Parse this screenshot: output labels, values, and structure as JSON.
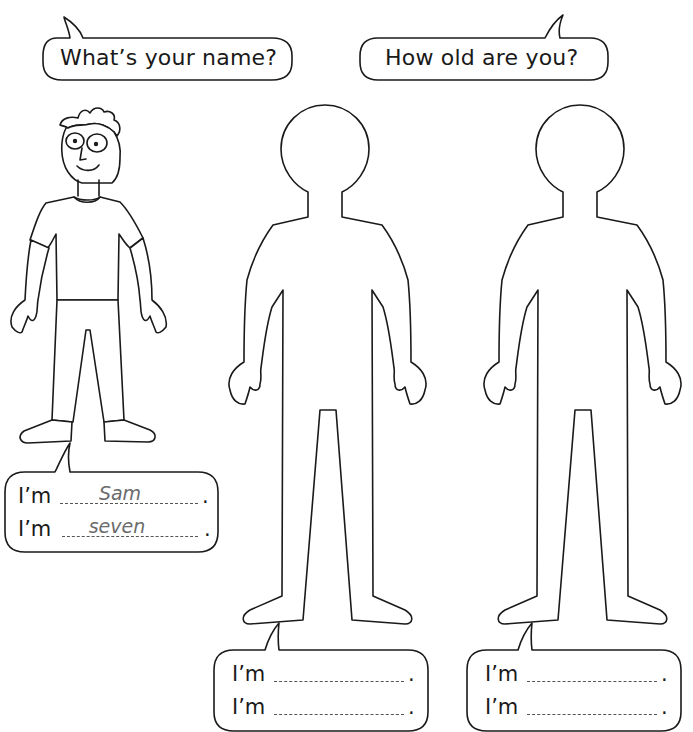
{
  "worksheet": {
    "questions": [
      {
        "text": "What’s your name?"
      },
      {
        "text": "How old are you?"
      }
    ],
    "answer_boxes": [
      {
        "figure": "example-boy",
        "lines": [
          {
            "prefix": "I’m",
            "answer": "Sam",
            "suffix": "."
          },
          {
            "prefix": "I’m",
            "answer": "seven",
            "suffix": "."
          }
        ]
      },
      {
        "figure": "blank-outline-1",
        "lines": [
          {
            "prefix": "I’m",
            "answer": "",
            "suffix": "."
          },
          {
            "prefix": "I’m",
            "answer": "",
            "suffix": "."
          }
        ]
      },
      {
        "figure": "blank-outline-2",
        "lines": [
          {
            "prefix": "I’m",
            "answer": "",
            "suffix": "."
          },
          {
            "prefix": "I’m",
            "answer": "",
            "suffix": "."
          }
        ]
      }
    ],
    "colors": {
      "ink": "#1a1a1a",
      "example_answer": "#6b6b6b",
      "background": "#ffffff"
    }
  }
}
